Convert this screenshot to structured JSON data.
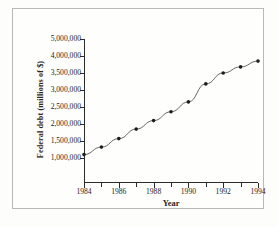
{
  "chart_data": {
    "type": "line",
    "title": "",
    "xlabel": "Year",
    "ylabel": "Federal debt (millions of $)",
    "x": [
      1984,
      1985,
      1986,
      1987,
      1988,
      1989,
      1990,
      1991,
      1992,
      1993,
      1994
    ],
    "values": [
      1600000,
      1820000,
      2070000,
      2350000,
      2600000,
      2860000,
      3150000,
      3680000,
      4000000,
      4180000,
      4350000
    ],
    "series": [
      {
        "name": "Federal debt",
        "values": [
          1600000,
          1820000,
          2070000,
          2350000,
          2600000,
          2860000,
          3150000,
          3680000,
          4000000,
          4180000,
          4350000
        ]
      }
    ],
    "xlim": [
      1984,
      1994
    ],
    "ylim": [
      1000000,
      5000000
    ],
    "grid": false,
    "legend": false,
    "marker": "filled-circle",
    "marker_color": "#1c1c1c",
    "line_color": "#555555",
    "y_tick_labels": [
      "5,000,000",
      "4,000,000",
      "3,500,000",
      "3,000,000",
      "2,500,000",
      "2,000,000",
      "1,500,000",
      "1,000,000"
    ],
    "y_tick_values": [
      5000000,
      4500000,
      4000000,
      3500000,
      3000000,
      2500000,
      2000000,
      1500000
    ],
    "x_tick_labels": [
      "1984",
      "1986",
      "1988",
      "1990",
      "1992",
      "1994"
    ],
    "x_tick_values": [
      1984,
      1986,
      1988,
      1990,
      1992,
      1994
    ],
    "x_minor_ticks": [
      1985,
      1987,
      1989,
      1991,
      1993
    ]
  },
  "colors": {
    "frame": "#b9b9b6",
    "axis": "#2b2b2b",
    "background": "#fefefd",
    "text": "#242424"
  }
}
